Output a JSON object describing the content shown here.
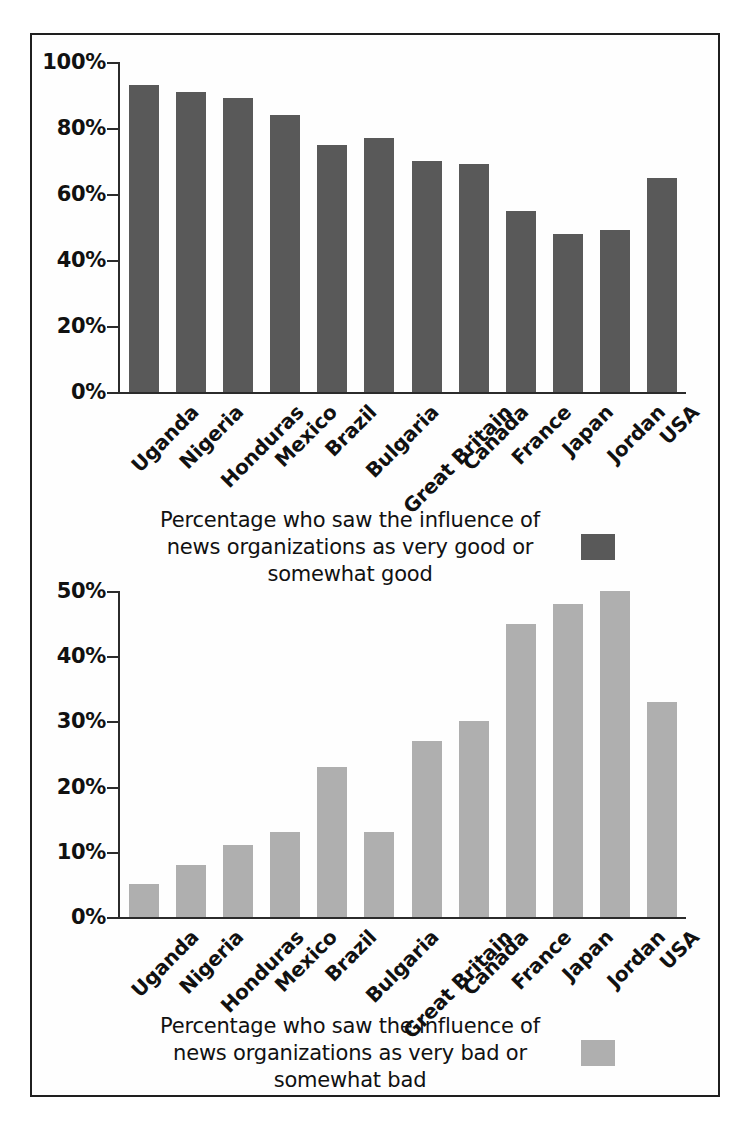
{
  "chart_data": [
    {
      "id": "good",
      "type": "bar",
      "title": "",
      "xlabel": "",
      "ylabel": "",
      "ylim": [
        0,
        100
      ],
      "ytick_labels": [
        "100%",
        "80%",
        "60%",
        "40%",
        "20%",
        "0%"
      ],
      "yticks": [
        100,
        80,
        60,
        40,
        20,
        0
      ],
      "grid": false,
      "legend_position": "bottom-center",
      "legend": "Percentage who saw the influence of news organizations as very good or somewhat good",
      "bar_color": "#595959",
      "categories": [
        "Uganda",
        "Nigeria",
        "Honduras",
        "Mexico",
        "Brazil",
        "Bulgaria",
        "Great Britain",
        "Canada",
        "France",
        "Japan",
        "Jordan",
        "USA"
      ],
      "values": [
        93,
        91,
        89,
        84,
        75,
        77,
        70,
        69,
        55,
        48,
        49,
        65
      ]
    },
    {
      "id": "bad",
      "type": "bar",
      "title": "",
      "xlabel": "",
      "ylabel": "",
      "ylim": [
        0,
        50
      ],
      "ytick_labels": [
        "50%",
        "40%",
        "30%",
        "20%",
        "10%",
        "0%"
      ],
      "yticks": [
        50,
        40,
        30,
        20,
        10,
        0
      ],
      "grid": false,
      "legend_position": "bottom-center",
      "legend": "Percentage who saw the influence of news organizations as very bad or somewhat bad",
      "bar_color": "#afafaf",
      "categories": [
        "Uganda",
        "Nigeria",
        "Honduras",
        "Mexico",
        "Brazil",
        "Bulgaria",
        "Great Britain",
        "Canada",
        "France",
        "Japan",
        "Jordan",
        "USA"
      ],
      "values": [
        5,
        8,
        11,
        13,
        23,
        13,
        27,
        30,
        45,
        48,
        50,
        33
      ]
    }
  ],
  "colors": {
    "good_bar": "#595959",
    "bad_bar": "#afafaf",
    "axis": "#2b2b2b",
    "frame": "#1f1f1f",
    "background": "#ffffff"
  }
}
